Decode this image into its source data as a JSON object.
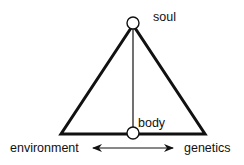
{
  "diagram": {
    "nodes": {
      "top": {
        "label": "soul"
      },
      "bottom": {
        "label": "body"
      }
    },
    "base_labels": {
      "left": "environment",
      "right": "genetics"
    },
    "colors": {
      "stroke": "#111111",
      "background": "#ffffff"
    }
  }
}
